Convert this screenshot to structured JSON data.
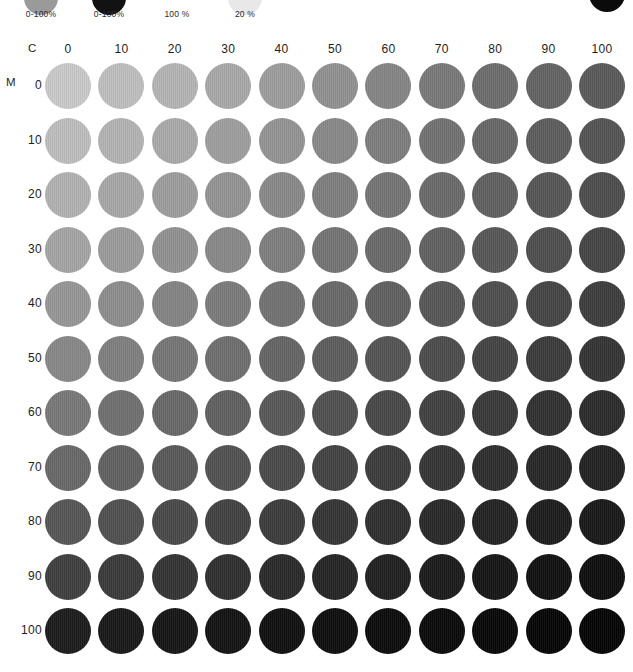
{
  "legend": {
    "items": [
      {
        "name": "gray-ramp",
        "label": "0-100%",
        "color": "#9a9a9a",
        "x": 10
      },
      {
        "name": "black-ramp",
        "label": "0-100%",
        "color": "#121212",
        "x": 78
      },
      {
        "name": "solid-100",
        "label": "100 %",
        "color": "#ffffff",
        "x": 146
      },
      {
        "name": "tint-20",
        "label": "20 %",
        "color": "#e8e8e8",
        "x": 214
      }
    ],
    "corner_swatch_color": "#0b0b0b"
  },
  "axes": {
    "column_axis_label": "C",
    "row_axis_label": "M",
    "column_values": [
      0,
      10,
      20,
      30,
      40,
      50,
      60,
      70,
      80,
      90,
      100
    ],
    "row_values": [
      0,
      10,
      20,
      30,
      40,
      50,
      60,
      70,
      80,
      90,
      100
    ],
    "column_labels": [
      "0",
      "10",
      "20",
      "30",
      "40",
      "50",
      "60",
      "70",
      "80",
      "90",
      "100"
    ],
    "row_labels": [
      "0",
      "10",
      "20",
      "30",
      "40",
      "50",
      "60",
      "70",
      "80",
      "90",
      "100"
    ]
  },
  "grid": {
    "columns": 11,
    "rows": 11,
    "column_pitch": 53.4,
    "row_pitch": 54.5,
    "first_column_x": 45,
    "patch_diameter": 46
  },
  "chart_data": {
    "type": "heatmap",
    "title": "",
    "xlabel": "C",
    "ylabel": "M",
    "x": [
      0,
      10,
      20,
      30,
      40,
      50,
      60,
      70,
      80,
      90,
      100
    ],
    "y": [
      0,
      10,
      20,
      30,
      40,
      50,
      60,
      70,
      80,
      90,
      100
    ],
    "legend_position": "top",
    "grid": false,
    "values": [
      [
        "#c9c9c9",
        "#bebebe",
        "#b4b4b4",
        "#a8a8a8",
        "#9d9d9d",
        "#919191",
        "#858585",
        "#797979",
        "#6d6d6d",
        "#636363",
        "#5a5a5a"
      ],
      [
        "#bdbdbd",
        "#b3b3b3",
        "#a9a9a9",
        "#9e9e9e",
        "#939393",
        "#888888",
        "#7d7d7d",
        "#727272",
        "#676767",
        "#5d5d5d",
        "#545454"
      ],
      [
        "#b1b1b1",
        "#a7a7a7",
        "#9d9d9d",
        "#939393",
        "#898989",
        "#7e7e7e",
        "#747474",
        "#6a6a6a",
        "#606060",
        "#565656",
        "#4d4d4d"
      ],
      [
        "#a4a4a4",
        "#9b9b9b",
        "#919191",
        "#888888",
        "#7e7e7e",
        "#747474",
        "#6a6a6a",
        "#616161",
        "#575757",
        "#4e4e4e",
        "#454545"
      ],
      [
        "#969696",
        "#8d8d8d",
        "#848484",
        "#7b7b7b",
        "#727272",
        "#696969",
        "#606060",
        "#575757",
        "#4e4e4e",
        "#454545",
        "#3d3d3d"
      ],
      [
        "#878787",
        "#7f7f7f",
        "#767676",
        "#6e6e6e",
        "#656565",
        "#5d5d5d",
        "#545454",
        "#4c4c4c",
        "#444444",
        "#3b3b3b",
        "#343434"
      ],
      [
        "#787878",
        "#707070",
        "#686868",
        "#606060",
        "#585858",
        "#505050",
        "#484848",
        "#414141",
        "#393939",
        "#313131",
        "#2b2b2b"
      ],
      [
        "#686868",
        "#616161",
        "#595959",
        "#525252",
        "#4a4a4a",
        "#434343",
        "#3c3c3c",
        "#353535",
        "#2e2e2e",
        "#272727",
        "#222222"
      ],
      [
        "#565656",
        "#505050",
        "#494949",
        "#424242",
        "#3c3c3c",
        "#353535",
        "#2f2f2f",
        "#292929",
        "#232323",
        "#1d1d1d",
        "#191919"
      ],
      [
        "#3f3f3f",
        "#3a3a3a",
        "#343434",
        "#2f2f2f",
        "#2a2a2a",
        "#252525",
        "#202020",
        "#1b1b1b",
        "#161616",
        "#111111",
        "#0e0e0e"
      ],
      [
        "#1c1c1c",
        "#191919",
        "#161616",
        "#131313",
        "#101010",
        "#0e0e0e",
        "#0c0c0c",
        "#0a0a0a",
        "#080808",
        "#060606",
        "#050505"
      ]
    ]
  }
}
